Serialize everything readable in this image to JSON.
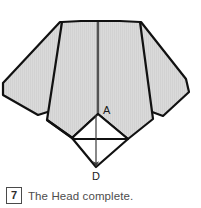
{
  "page": {
    "background_color": "#ffffff",
    "width": 201,
    "height": 208
  },
  "figure": {
    "paper_fill_color": "#d8d8d8",
    "paper_stroke_color": "#111111",
    "fold_line_color": "#8a8a8a",
    "white_facet_color": "#ffffff",
    "labels": [
      {
        "id": "A",
        "text": "A",
        "x": 103,
        "y": 114
      },
      {
        "id": "D",
        "text": "D",
        "x": 92,
        "y": 180
      }
    ],
    "arrow": {
      "name": "fold-direction-arrow",
      "from_x": 96,
      "from_y": 113,
      "to_x": 96,
      "to_y": 168,
      "color": "#3a3a3a"
    }
  },
  "caption": {
    "step_number": "7",
    "text": "The Head complete."
  }
}
